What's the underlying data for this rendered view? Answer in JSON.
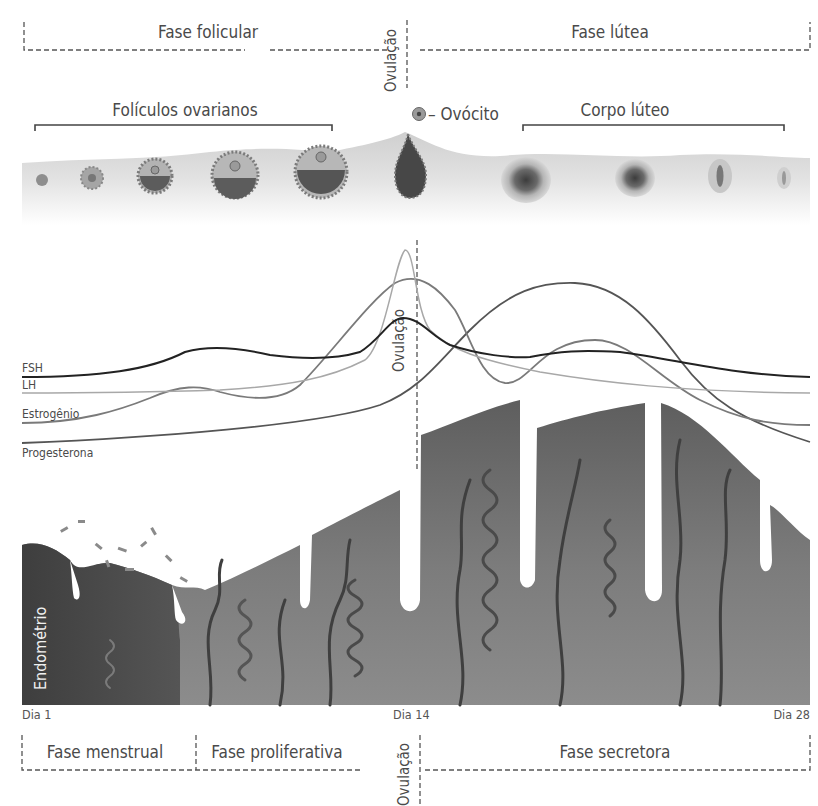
{
  "diagram": {
    "top_phases": {
      "follicular": "Fase folicular",
      "luteal": "Fase lútea",
      "ovulation": "Ovulação"
    },
    "ovary": {
      "follicles_label": "Folículos ovarianos",
      "oocyte_label": "– Ovócito",
      "corpus_luteum_label": "Corpo lúteo"
    },
    "hormones": {
      "ovulation_label": "Ovulação",
      "series": [
        {
          "name": "FSH",
          "color": "#222222"
        },
        {
          "name": "LH",
          "color": "#a8a8a8"
        },
        {
          "name": "Estrogênio",
          "color": "#7a7a7a"
        },
        {
          "name": "Progesterona",
          "color": "#555555"
        }
      ]
    },
    "endometrium": {
      "label": "Endométrio",
      "colors": {
        "dark": "#4c4c4c",
        "mid": "#6e6e6e",
        "light": "#9a9a9a",
        "vessel": "#3f3f3f"
      }
    },
    "days": {
      "start": "Dia 1",
      "mid": "Dia 14",
      "end": "Dia 28"
    },
    "bottom_phases": {
      "menstrual": "Fase menstrual",
      "proliferative": "Fase proliferativa",
      "ovulation": "Ovulação",
      "secretory": "Fase secretora"
    }
  }
}
